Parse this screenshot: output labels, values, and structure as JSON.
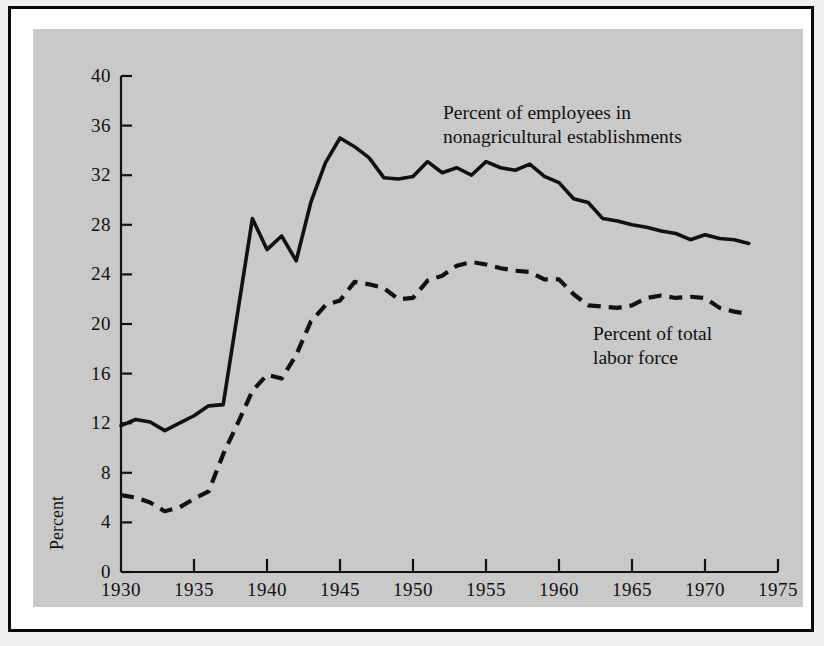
{
  "chart_data": {
    "type": "line",
    "title": "",
    "subtitle": "",
    "xlabel": "",
    "ylabel": "Percent",
    "xlim": [
      1930,
      1975
    ],
    "ylim": [
      0,
      40
    ],
    "xticks": [
      1930,
      1935,
      1940,
      1945,
      1950,
      1955,
      1960,
      1965,
      1970,
      1975
    ],
    "yticks": [
      0,
      4,
      8,
      12,
      16,
      20,
      24,
      28,
      32,
      36,
      40
    ],
    "grid": false,
    "legend_position": "inline-annotations",
    "annotations": [
      {
        "id": "annotation-nonagricultural",
        "lines": [
          "Percent of employees in",
          "nonagricultural establishments"
        ],
        "series": "nonagricultural_establishments"
      },
      {
        "id": "annotation-labor-force",
        "lines": [
          "Percent of total",
          "labor force"
        ],
        "series": "total_labor_force"
      }
    ],
    "series": [
      {
        "name": "Percent of employees in nonagricultural establishments",
        "style": "solid",
        "color": "#111111",
        "x": [
          1930,
          1931,
          1932,
          1933,
          1934,
          1935,
          1936,
          1937,
          1938,
          1939,
          1940,
          1941,
          1942,
          1943,
          1944,
          1945,
          1946,
          1947,
          1948,
          1949,
          1950,
          1951,
          1952,
          1953,
          1954,
          1955,
          1956,
          1957,
          1958,
          1959,
          1960,
          1961,
          1962,
          1963,
          1964,
          1965,
          1966,
          1967,
          1968,
          1969,
          1970,
          1971,
          1972,
          1973
        ],
        "values": [
          11.8,
          12.3,
          12.1,
          11.4,
          12.0,
          12.6,
          13.4,
          13.5,
          21.0,
          28.5,
          26.0,
          27.1,
          25.1,
          29.8,
          33.0,
          35.0,
          34.3,
          33.4,
          31.8,
          31.7,
          31.9,
          33.1,
          32.2,
          32.6,
          32.0,
          33.1,
          32.6,
          32.4,
          32.9,
          31.9,
          31.4,
          30.1,
          29.8,
          28.5,
          28.3,
          28.0,
          27.8,
          27.5,
          27.3,
          26.8,
          27.2,
          26.9,
          26.8,
          26.5
        ]
      },
      {
        "name": "Percent of total labor force",
        "style": "dashed",
        "color": "#111111",
        "x": [
          1930,
          1931,
          1932,
          1933,
          1934,
          1935,
          1936,
          1937,
          1938,
          1939,
          1940,
          1941,
          1942,
          1943,
          1944,
          1945,
          1946,
          1947,
          1948,
          1949,
          1950,
          1951,
          1952,
          1953,
          1954,
          1955,
          1956,
          1957,
          1958,
          1959,
          1960,
          1961,
          1962,
          1963,
          1964,
          1965,
          1966,
          1967,
          1968,
          1969,
          1970,
          1971,
          1972,
          1973
        ],
        "values": [
          6.2,
          6.0,
          5.6,
          4.9,
          5.2,
          5.9,
          6.5,
          9.5,
          12.0,
          14.6,
          15.9,
          15.6,
          17.5,
          20.2,
          21.5,
          21.9,
          23.4,
          23.2,
          22.9,
          22.0,
          22.1,
          23.5,
          23.9,
          24.7,
          25.0,
          24.8,
          24.5,
          24.3,
          24.2,
          23.6,
          23.6,
          22.4,
          21.5,
          21.4,
          21.3,
          21.5,
          22.1,
          22.3,
          22.1,
          22.2,
          22.1,
          21.3,
          21.0,
          20.8
        ]
      }
    ]
  },
  "axis": {
    "ylabel": "Percent",
    "ytick_labels": [
      "40",
      "36",
      "32",
      "28",
      "24",
      "20",
      "16",
      "12",
      "8",
      "4",
      "0"
    ],
    "xtick_labels": [
      "1930",
      "1935",
      "1940",
      "1945",
      "1950",
      "1955",
      "1960",
      "1965",
      "1970",
      "1975"
    ]
  },
  "annotations": {
    "nonagricultural": {
      "line1": "Percent of employees in",
      "line2": "nonagricultural establishments"
    },
    "labor_force": {
      "line1": "Percent of total",
      "line2": "labor force"
    }
  },
  "colors": {
    "page_background": "#f2f0ee",
    "frame_border": "#0a0a0a",
    "panel_background": "#c9c9c9",
    "ink": "#111111"
  }
}
